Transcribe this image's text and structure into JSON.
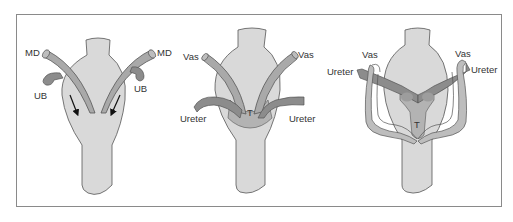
{
  "figure": {
    "panels": [
      {
        "id": "panel-1",
        "labels": {
          "md_left": "MD",
          "md_right": "MD",
          "ub_left": "UB",
          "ub_right": "UB"
        },
        "arrows": 2
      },
      {
        "id": "panel-2",
        "labels": {
          "vas_left": "Vas",
          "vas_right": "Vas",
          "ureter_left": "Ureter",
          "ureter_right": "Ureter",
          "trigone": "T"
        }
      },
      {
        "id": "panel-3",
        "labels": {
          "vas_left": "Vas",
          "vas_right": "Vas",
          "ureter_left": "Ureter",
          "ureter_right": "Ureter",
          "trigone": "T"
        }
      }
    ],
    "colors": {
      "frame": "#8a8a8a",
      "body_fill": "#d9d9d9",
      "outline": "#555555",
      "duct_fill": "#a9a9a9",
      "ureter_fill": "#8c8c8c",
      "trigone_fill": "#b3b3b3",
      "text": "#333333"
    }
  }
}
